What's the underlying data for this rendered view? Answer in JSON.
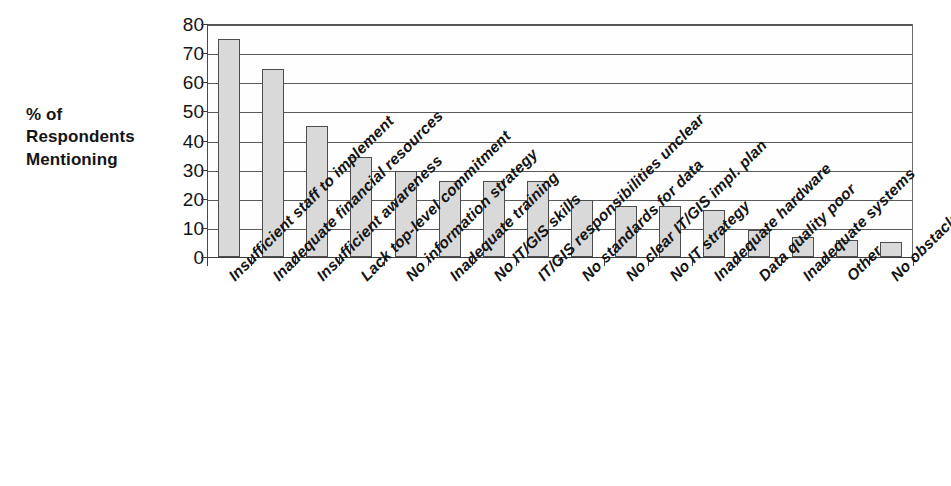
{
  "chart_data": {
    "type": "bar",
    "title": "",
    "subtitle": "",
    "xlabel": "",
    "ylabel": "% of Respondents Mentioning",
    "ylim": [
      0,
      80
    ],
    "yticks": [
      0,
      10,
      20,
      30,
      40,
      50,
      60,
      70,
      80
    ],
    "ytick_labels": [
      "0",
      "10",
      "20",
      "30",
      "40",
      "50",
      "60",
      "70",
      "80"
    ],
    "grid": true,
    "legend": null,
    "orientation": "vertical",
    "bar_color": "#d9d9d9",
    "bar_edge_color": "#4d4d4d",
    "categories": [
      "Insufficient staff to implement",
      "Inadequate financial resources",
      "Insufficient awareness",
      "Lack top-level commitment",
      "No information strategy",
      "Inadequate training",
      "No IT/GIS skills",
      "IT/GIS responsibilities unclear",
      "No standards for data",
      "No clear IT/GIS impl. plan",
      "No IT strategy",
      "Inadequate hardware",
      "Data quality poor",
      "Inadequate systems",
      "Other",
      "No obstacles"
    ],
    "values": [
      75,
      64.5,
      45,
      34.5,
      29.5,
      26,
      26,
      26,
      19.5,
      17.5,
      17.5,
      16,
      9.3,
      7,
      6,
      5
    ]
  },
  "axis_title": {
    "line1": "% of",
    "line2": "Respondents",
    "line3": "Mentioning"
  }
}
